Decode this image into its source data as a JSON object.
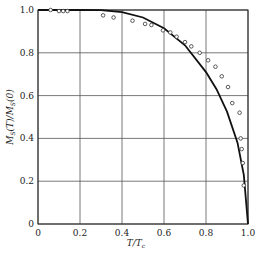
{
  "chart_data": {
    "type": "line",
    "title": "",
    "xlabel": "T/T_c",
    "ylabel": "M_S(T)/M_S(0)",
    "xlim": [
      0,
      1.0
    ],
    "ylim": [
      0,
      1.0
    ],
    "grid": true,
    "legend": "none",
    "x_ticks": [
      "0",
      "0.2",
      "0.4",
      "0.6",
      "0.8",
      "1.0"
    ],
    "y_ticks": [
      "0",
      "0.2",
      "0.4",
      "0.6",
      "0.8",
      "1.0"
    ],
    "series": [
      {
        "name": "theory (mean-field curve)",
        "style": "solid line",
        "x": [
          0,
          0.1,
          0.2,
          0.3,
          0.4,
          0.5,
          0.6,
          0.7,
          0.8,
          0.85,
          0.9,
          0.95,
          0.98,
          1.0
        ],
        "y": [
          1.0,
          1.0,
          1.0,
          0.999,
          0.99,
          0.965,
          0.915,
          0.835,
          0.71,
          0.63,
          0.525,
          0.38,
          0.23,
          0.0
        ]
      },
      {
        "name": "experimental data",
        "style": "open circles",
        "x": [
          0.06,
          0.1,
          0.12,
          0.14,
          0.31,
          0.36,
          0.45,
          0.51,
          0.54,
          0.595,
          0.63,
          0.66,
          0.7,
          0.73,
          0.77,
          0.81,
          0.845,
          0.875,
          0.905,
          0.925,
          0.96,
          0.965,
          0.97,
          0.975,
          0.98
        ],
        "y": [
          1.0,
          0.995,
          0.995,
          0.995,
          0.975,
          0.965,
          0.95,
          0.935,
          0.93,
          0.905,
          0.895,
          0.875,
          0.85,
          0.83,
          0.8,
          0.765,
          0.735,
          0.69,
          0.64,
          0.565,
          0.52,
          0.4,
          0.35,
          0.285,
          0.18
        ]
      }
    ]
  },
  "labels": {
    "xlabel_main": "T/T",
    "xlabel_sub": "c",
    "ylabel_text": "M_S(T)/M_S(0)"
  },
  "colors": {
    "line": "#111111",
    "grid": "#555555",
    "marker": "#333333",
    "background": "#ffffff"
  }
}
